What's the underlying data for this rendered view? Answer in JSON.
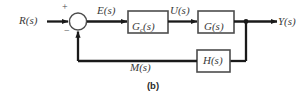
{
  "figure": {
    "caption": "(b)",
    "type": "control-system-block-diagram",
    "colors": {
      "line": "#1a1a1a",
      "block_stroke": "#4d4d4d",
      "block_fill": "#ffffff",
      "label_text": "#3a3a3a",
      "caption_text": "#2b2b2b",
      "background": "#ffffff"
    }
  },
  "signals": {
    "input": "R(s)",
    "error": "E(s)",
    "control": "U(s)",
    "output": "Y(s)",
    "feedback": "M(s)"
  },
  "blocks": {
    "compensator": {
      "name": "G",
      "subscript": "c",
      "arg": "(s)"
    },
    "plant": {
      "name": "G",
      "subscript": "",
      "arg": "(s)"
    },
    "sensor": {
      "name": "H",
      "subscript": "",
      "arg": "(s)"
    }
  },
  "summing_junction": {
    "positive_sign": "+",
    "negative_sign": "−"
  }
}
